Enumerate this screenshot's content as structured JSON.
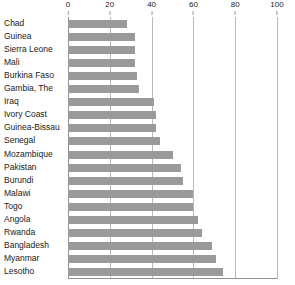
{
  "chart_data": {
    "type": "bar",
    "orientation": "horizontal",
    "title": "",
    "subtitle": "",
    "xlabel": "",
    "ylabel": "",
    "xlim": [
      0,
      100
    ],
    "xticks": [
      0,
      20,
      40,
      60,
      80,
      100
    ],
    "ticklabels": [
      "0",
      "20",
      "40",
      "60",
      "80",
      "100"
    ],
    "grid": true,
    "grid_axis": "x",
    "legend": false,
    "legend_position": "none",
    "bar_color": "#9a9a9a",
    "gridline_color": "#b9b9b9",
    "axis_color": "#8f8f8f",
    "background": "#ffffff",
    "categories": [
      "Chad",
      "Guinea",
      "Sierra Leone",
      "Mali",
      "Burkina Faso",
      "Gambia, The",
      "Iraq",
      "Ivory Coast",
      "Guinea-Bissau",
      "Senegal",
      "Mozambique",
      "Pakistan",
      "Burundi",
      "Malawi",
      "Togo",
      "Angola",
      "Rwanda",
      "Bangladesh",
      "Myanmar",
      "Lesotho"
    ],
    "values": [
      28,
      32,
      32,
      32,
      33,
      34,
      41,
      42,
      42,
      44,
      50,
      54,
      55,
      60,
      60,
      62,
      64,
      69,
      71,
      74
    ]
  }
}
